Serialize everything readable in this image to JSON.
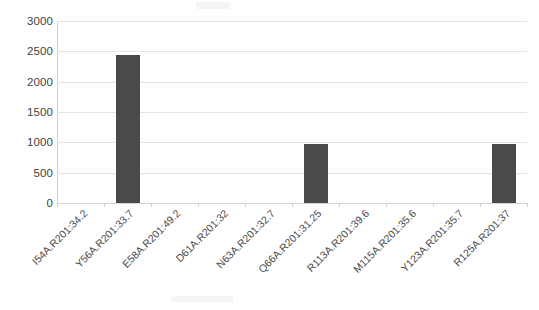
{
  "chart_data": {
    "type": "bar",
    "title": "",
    "subtitle": "",
    "xlabel": "",
    "ylabel": "",
    "ylim": [
      0,
      3000
    ],
    "ytick_values": [
      3000,
      2500,
      2000,
      1500,
      1000,
      500,
      0
    ],
    "ytick_labels": [
      "3000",
      "2500",
      "2000",
      "1500",
      "1000",
      "500",
      "0"
    ],
    "grid": true,
    "legend": false,
    "legend_position": "none",
    "bar_color": "#4a4a4a",
    "gridline_color": "#e4e4e4",
    "axis_color": "#cfcfcf",
    "categories": [
      "I54A.R201:34.2",
      "Y56A.R201:33.7",
      "E58A.R201:49.2",
      "D61A.R201:32",
      "N63A.R201:32.7",
      "Q66A.R201:31.25",
      "R113A.R201:39.6",
      "M115A.R201:35.6",
      "Y123A.R201:35.7",
      "R125A.R201:37"
    ],
    "values": [
      0,
      2440,
      0,
      0,
      0,
      975,
      0,
      0,
      0,
      965
    ]
  }
}
